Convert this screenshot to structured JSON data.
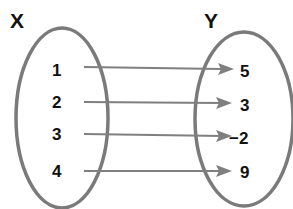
{
  "diagram": {
    "type": "mapping-diagram",
    "domain_set": {
      "label": "X",
      "elements": [
        "1",
        "2",
        "3",
        "4"
      ]
    },
    "range_set": {
      "label": "Y",
      "elements": [
        "5",
        "3",
        "−2",
        "9"
      ]
    },
    "mappings": [
      {
        "from": "1",
        "to": "5"
      },
      {
        "from": "2",
        "to": "3"
      },
      {
        "from": "3",
        "to": "−2"
      },
      {
        "from": "4",
        "to": "9"
      }
    ],
    "colors": {
      "oval_stroke": "#7a7a7a",
      "arrow": "#7f7f7f",
      "text": "#111111",
      "background": "#ffffff"
    }
  }
}
